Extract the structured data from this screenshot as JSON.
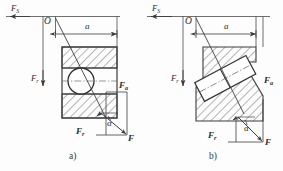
{
  "figure": {
    "background_color": "#fdfdfd",
    "line_color": "#3c3c3c",
    "hatch_color": "#5a5a5a"
  },
  "panels": [
    {
      "id": "a",
      "caption": "a)",
      "bearing_type": "angular contact ball bearing",
      "labels": {
        "support_force": "F",
        "support_force_sub": "S",
        "radial_force": "F",
        "radial_force_sub": "r",
        "axial_force": "F",
        "axial_force_sub": "a",
        "resultant_force": "F",
        "angle": "α",
        "dimension": "a",
        "origin": "O"
      }
    },
    {
      "id": "b",
      "caption": "b)",
      "bearing_type": "tapered roller bearing",
      "labels": {
        "support_force": "F",
        "support_force_sub": "S",
        "radial_force": "F",
        "radial_force_sub": "r",
        "axial_force": "F",
        "axial_force_sub": "a",
        "resultant_force": "F",
        "angle": "α",
        "dimension": "a",
        "origin": "O"
      }
    }
  ]
}
